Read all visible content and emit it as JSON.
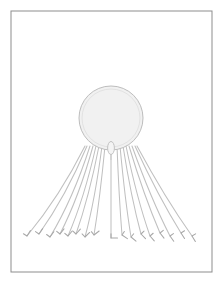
{
  "canvas": {
    "width": 222,
    "height": 286,
    "background_color": "#ffffff",
    "title": "Jellyfish line drawing"
  },
  "frame": {
    "label": "border-frame",
    "x": 11,
    "y": 11,
    "width": 201,
    "height": 261,
    "stroke_color": "#8d8d8d",
    "stroke_width": 1,
    "fill_color": "#ffffff"
  },
  "subject": {
    "name": "jellyfish",
    "description": "Pale circular bell with long tentacles fanning downward, each ending in a small hooked barb"
  },
  "bell": {
    "label": "jellyfish-bell",
    "cx": 111,
    "cy": 118,
    "r": 32,
    "fill_color": "#f1f1f1",
    "stroke_color": "#bdbdbd",
    "stroke_width": 1
  },
  "inner_bell": {
    "label": "bell-inner-arc",
    "cx": 111,
    "cy": 118,
    "r": 29,
    "stroke_color": "#e2e2e2",
    "stroke_width": 1
  },
  "manubrium": {
    "label": "manubrium",
    "cx": 111,
    "cy": 148,
    "rx": 3.4,
    "ry": 6.5,
    "stem_top_y": 141,
    "stem_bottom_y": 160,
    "fill_color": "#f4f4f4",
    "stroke_color": "#c2c2c2",
    "stroke_width": 1
  },
  "tentacles": {
    "label": "tentacle-group",
    "count": 17,
    "stroke_color": "#c0c0c0",
    "stroke_width": 1.05,
    "tip_stroke_color": "#a8a8a8",
    "origin_y": 146,
    "tip_y_base": 238,
    "items": [
      {
        "id": 1,
        "origin_x": 85,
        "tip_x": 27,
        "tip_y": 236,
        "ctrl_x": 60,
        "ctrl_y": 196,
        "barb_angle": -58
      },
      {
        "id": 2,
        "origin_x": 87,
        "tip_x": 39,
        "tip_y": 234,
        "ctrl_x": 66,
        "ctrl_y": 196,
        "barb_angle": -56
      },
      {
        "id": 3,
        "origin_x": 90,
        "tip_x": 50,
        "tip_y": 237,
        "ctrl_x": 73,
        "ctrl_y": 199,
        "barb_angle": -54
      },
      {
        "id": 4,
        "origin_x": 93,
        "tip_x": 60,
        "tip_y": 234,
        "ctrl_x": 79,
        "ctrl_y": 197,
        "barb_angle": -52
      },
      {
        "id": 5,
        "origin_x": 96,
        "tip_x": 68,
        "tip_y": 236,
        "ctrl_x": 84,
        "ctrl_y": 199,
        "barb_angle": -50
      },
      {
        "id": 6,
        "origin_x": 99,
        "tip_x": 76,
        "tip_y": 234,
        "ctrl_x": 89,
        "ctrl_y": 197,
        "barb_angle": -48
      },
      {
        "id": 7,
        "origin_x": 102,
        "tip_x": 85,
        "tip_y": 237,
        "ctrl_x": 95,
        "ctrl_y": 200,
        "barb_angle": -44
      },
      {
        "id": 8,
        "origin_x": 105,
        "tip_x": 94,
        "tip_y": 235,
        "ctrl_x": 100,
        "ctrl_y": 198,
        "barb_angle": -38
      },
      {
        "id": 9,
        "origin_x": 111,
        "tip_x": 111,
        "tip_y": 238,
        "ctrl_x": 111,
        "ctrl_y": 200,
        "barb_angle": 0
      },
      {
        "id": 10,
        "origin_x": 117,
        "tip_x": 122,
        "tip_y": 235,
        "ctrl_x": 119,
        "ctrl_y": 198,
        "barb_angle": 34
      },
      {
        "id": 11,
        "origin_x": 120,
        "tip_x": 131,
        "tip_y": 237,
        "ctrl_x": 125,
        "ctrl_y": 200,
        "barb_angle": 40
      },
      {
        "id": 12,
        "origin_x": 123,
        "tip_x": 141,
        "tip_y": 234,
        "ctrl_x": 131,
        "ctrl_y": 197,
        "barb_angle": 46
      },
      {
        "id": 13,
        "origin_x": 126,
        "tip_x": 150,
        "tip_y": 236,
        "ctrl_x": 137,
        "ctrl_y": 199,
        "barb_angle": 49
      },
      {
        "id": 14,
        "origin_x": 129,
        "tip_x": 160,
        "tip_y": 233,
        "ctrl_x": 144,
        "ctrl_y": 196,
        "barb_angle": 52
      },
      {
        "id": 15,
        "origin_x": 132,
        "tip_x": 170,
        "tip_y": 236,
        "ctrl_x": 151,
        "ctrl_y": 199,
        "barb_angle": 55
      },
      {
        "id": 16,
        "origin_x": 135,
        "tip_x": 181,
        "tip_y": 233,
        "ctrl_x": 158,
        "ctrl_y": 196,
        "barb_angle": 57
      },
      {
        "id": 17,
        "origin_x": 137,
        "tip_x": 192,
        "tip_y": 236,
        "ctrl_x": 165,
        "ctrl_y": 198,
        "barb_angle": 59
      }
    ]
  },
  "palette": {
    "paper": "#ffffff",
    "frame_line": "#8d8d8d",
    "bell_fill": "#f1f1f1",
    "bell_outline": "#bdbdbd",
    "tentacle_line": "#c0c0c0",
    "barb_line": "#a8a8a8"
  }
}
